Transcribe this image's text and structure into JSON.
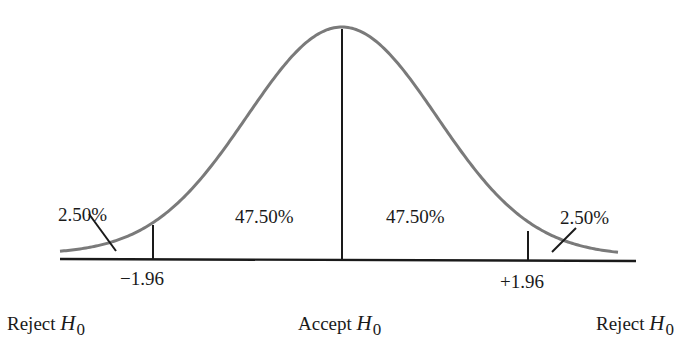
{
  "chart_data": {
    "type": "area",
    "title": "",
    "xlabel": "",
    "ylabel": "",
    "critical_values": [
      "-1.96",
      "+1.96"
    ],
    "areas": [
      {
        "region": "left tail",
        "label": "2.50%",
        "value": 2.5
      },
      {
        "region": "left center",
        "label": "47.50%",
        "value": 47.5
      },
      {
        "region": "right center",
        "label": "47.50%",
        "value": 47.5
      },
      {
        "region": "right tail",
        "label": "2.50%",
        "value": 2.5
      }
    ],
    "regions": [
      {
        "label": "Reject H0",
        "position": "left"
      },
      {
        "label": "Accept H0",
        "position": "center"
      },
      {
        "label": "Reject H0",
        "position": "right"
      }
    ],
    "curve_color": "#7a7a7a",
    "line_color": "#1a1a1a"
  },
  "labels": {
    "left_tail": "2.50%",
    "left_center": "47.50%",
    "right_center": "47.50%",
    "right_tail": "2.50%",
    "neg_critical": "−1.96",
    "pos_critical": "+1.96"
  },
  "regions": {
    "left": {
      "word": "Reject",
      "symbol": "H",
      "sub": "0"
    },
    "center": {
      "word": "Accept",
      "symbol": "H",
      "sub": "0"
    },
    "right": {
      "word": "Reject",
      "symbol": "H",
      "sub": "0"
    }
  }
}
